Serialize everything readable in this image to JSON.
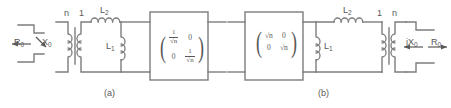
{
  "figure": {
    "type": "circuit-diagram",
    "background_color": "#ffffff",
    "line_color": "#7d7d7d",
    "text_color": "#585858"
  },
  "panel_a": {
    "caption": "(a)",
    "source": {
      "resistance_label": "R",
      "resistance_sub": "0",
      "reactance_label": "X",
      "reactance_sub": "0",
      "resistance_arrow": "left",
      "reactance_arrow": "down-right"
    },
    "transformer": {
      "primary_turns_label": "n",
      "secondary_turns_label": "1"
    },
    "series_inductor": {
      "label": "L",
      "sub": "2"
    },
    "shunt_inductor": {
      "label": "L",
      "sub": "1"
    },
    "matrix_box": {
      "rows": [
        [
          "1/√n",
          "0"
        ],
        [
          "0",
          "1/√n"
        ]
      ],
      "cell_00_num": "1",
      "cell_00_den": "√n",
      "cell_01": "0",
      "cell_10": "0",
      "cell_11_num": "1",
      "cell_11_den": "√n"
    }
  },
  "panel_b": {
    "caption": "(b)",
    "matrix_box": {
      "rows": [
        [
          "√n",
          "0"
        ],
        [
          "0",
          "√n"
        ]
      ],
      "cell_00": "√n",
      "cell_01": "0",
      "cell_10": "0",
      "cell_11": "√n"
    },
    "series_inductor": {
      "label": "L",
      "sub": "2"
    },
    "shunt_inductor": {
      "label": "L",
      "sub": "1"
    },
    "transformer": {
      "primary_turns_label": "1",
      "secondary_turns_label": "n"
    },
    "load": {
      "reactance_label": "jX",
      "reactance_sub": "0",
      "resistance_label": "R",
      "resistance_sub": "0",
      "reactance_arrow": "left",
      "resistance_arrow": "right"
    }
  }
}
